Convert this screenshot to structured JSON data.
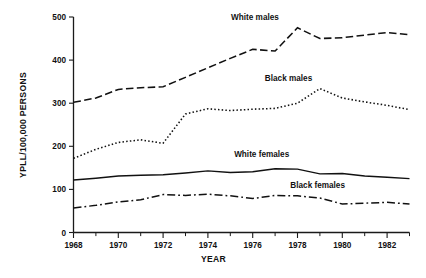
{
  "chart_data": {
    "type": "line",
    "title": "",
    "xlabel": "YEAR",
    "ylabel": "YPLL/100,000 PERSONS",
    "xlim": [
      1968,
      1983
    ],
    "ylim": [
      0,
      500
    ],
    "grid": false,
    "legend_position": "inline-annotations",
    "y_ticks": [
      0,
      100,
      200,
      300,
      400,
      500
    ],
    "y_tick_labels": [
      "0",
      "100",
      "200",
      "300",
      "400",
      "500"
    ],
    "x_ticks": [
      1968,
      1969,
      1970,
      1971,
      1972,
      1973,
      1974,
      1975,
      1976,
      1977,
      1978,
      1979,
      1980,
      1981,
      1982,
      1983
    ],
    "x_tick_labels_major": [
      "1968",
      "1970",
      "1972",
      "1974",
      "1976",
      "1978",
      "1980",
      "1982"
    ],
    "x_major_years": [
      1968,
      1970,
      1972,
      1974,
      1976,
      1978,
      1980,
      1982
    ],
    "x": [
      1968,
      1969,
      1970,
      1971,
      1972,
      1973,
      1974,
      1975,
      1976,
      1977,
      1978,
      1979,
      1980,
      1981,
      1982,
      1983
    ],
    "series": [
      {
        "name": "White males",
        "style": "dashed",
        "label_x": 1976.1,
        "label_y": 492,
        "values": [
          302,
          312,
          332,
          336,
          338,
          360,
          382,
          404,
          425,
          421,
          475,
          450,
          452,
          458,
          464,
          459
        ]
      },
      {
        "name": "Black males",
        "style": "dotted",
        "label_x": 1977.6,
        "label_y": 352,
        "values": [
          172,
          193,
          209,
          215,
          207,
          275,
          287,
          283,
          286,
          288,
          300,
          334,
          312,
          303,
          295,
          285
        ]
      },
      {
        "name": "White females",
        "style": "solid",
        "label_x": 1976.4,
        "label_y": 175,
        "values": [
          122,
          126,
          131,
          133,
          134,
          138,
          143,
          139,
          141,
          148,
          147,
          136,
          137,
          131,
          128,
          125
        ]
      },
      {
        "name": "Black females",
        "style": "dashdot",
        "label_x": 1978.9,
        "label_y": 104,
        "values": [
          57,
          63,
          71,
          76,
          88,
          86,
          89,
          85,
          79,
          86,
          85,
          80,
          66,
          68,
          70,
          66
        ]
      }
    ]
  },
  "colors": {
    "axis": "#1a1a1a",
    "line": "#111111",
    "background": "#ffffff"
  }
}
